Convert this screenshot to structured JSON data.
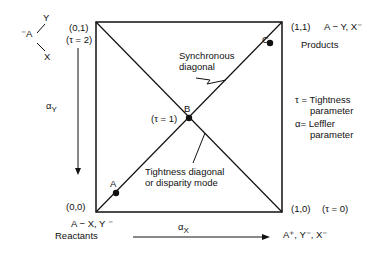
{
  "molecule": {
    "center": "⁻A",
    "top": "Y",
    "bottom": "X"
  },
  "corners": {
    "top_left": {
      "coord": "(0,1)",
      "tau": "(τ = 2)"
    },
    "top_right": {
      "coord": "(1,1)",
      "species": "A − Y, X⁻",
      "label": "Products"
    },
    "bottom_left": {
      "coord": "(0,0)",
      "species": "A − X, Y ⁻",
      "label": "Reactants"
    },
    "bottom_right": {
      "coord": "(1,0)",
      "tau": "(τ = 0)",
      "species": "A⁺, Y⁻, X⁻"
    }
  },
  "points": {
    "A": "A",
    "B": "B",
    "C": "C",
    "B_tau": "(τ = 1)"
  },
  "annotations": {
    "synchronous_1": "Synchronous",
    "synchronous_2": "diagonal",
    "tightness_1": "Tightness diagonal",
    "tightness_2": "or disparity mode"
  },
  "legend": {
    "tau_1": "τ = Tightness",
    "tau_2": "parameter",
    "alpha_1": "α= Leffler",
    "alpha_2": "parameter"
  },
  "axes": {
    "y_label": "α",
    "y_sub": "Y",
    "x_label": "α",
    "x_sub": "X"
  }
}
